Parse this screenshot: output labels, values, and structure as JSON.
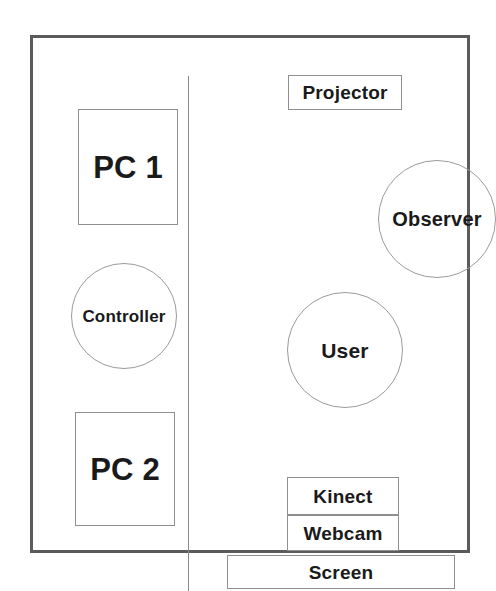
{
  "diagram": {
    "type": "floor-plan",
    "background_color": "#ffffff",
    "outline_color": "#5b5b5b",
    "node_border_color": "#8f8f8f",
    "text_color": "#1a1a1a",
    "rooms": [
      {
        "id": "control-room",
        "label": ""
      },
      {
        "id": "main-room",
        "label": ""
      }
    ],
    "nodes": [
      {
        "id": "pc1",
        "label": "PC 1",
        "shape": "rect",
        "room": "control-room"
      },
      {
        "id": "controller",
        "label": "Controller",
        "shape": "circle",
        "room": "control-room"
      },
      {
        "id": "pc2",
        "label": "PC 2",
        "shape": "rect",
        "room": "control-room"
      },
      {
        "id": "projector",
        "label": "Projector",
        "shape": "rect",
        "room": "main-room"
      },
      {
        "id": "observer",
        "label": "Observer",
        "shape": "circle",
        "room": "main-room"
      },
      {
        "id": "user",
        "label": "User",
        "shape": "circle",
        "room": "main-room"
      },
      {
        "id": "kinect",
        "label": "Kinect",
        "shape": "rect",
        "room": "main-room"
      },
      {
        "id": "webcam",
        "label": "Webcam",
        "shape": "rect",
        "room": "main-room"
      },
      {
        "id": "screen",
        "label": "Screen",
        "shape": "rect",
        "room": "main-room"
      }
    ]
  }
}
